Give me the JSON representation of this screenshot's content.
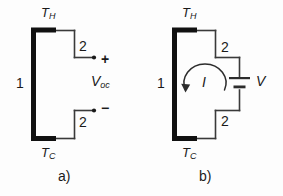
{
  "figure": {
    "background_color": "#fdfdfd",
    "line_color": "#3a3a3a",
    "thick_bar_color": "#111111",
    "text_color": "#1a1a1a"
  },
  "panel_a": {
    "caption": "a)",
    "hot_label": "T",
    "hot_sub": "H",
    "cold_label": "T",
    "cold_sub": "C",
    "leg_label": "1",
    "top_lead_label": "2",
    "bottom_lead_label": "2",
    "plus_sign": "+",
    "minus_sign": "−",
    "voltage_label": "V",
    "voltage_sub": "oc"
  },
  "panel_b": {
    "caption": "b)",
    "hot_label": "T",
    "hot_sub": "H",
    "cold_label": "T",
    "cold_sub": "C",
    "leg_label": "1",
    "top_lead_label": "2",
    "bottom_lead_label": "2",
    "current_label": "I",
    "load_label": "V"
  }
}
